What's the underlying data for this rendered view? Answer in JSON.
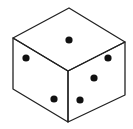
{
  "figure": {
    "stroke_color": "#222222",
    "pip_color": "#111111",
    "background": "#ffffff",
    "faces": {
      "top": {
        "pips": 1
      },
      "left": {
        "pips": 2
      },
      "right": {
        "pips": 3
      }
    }
  }
}
